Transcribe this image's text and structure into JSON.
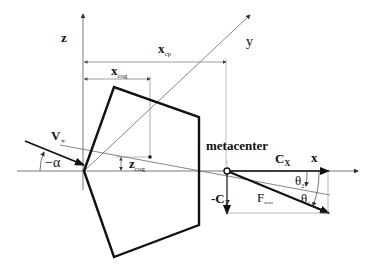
{
  "diagram": {
    "axes": {
      "x_label": "x",
      "y_label": "y",
      "z_label": "z"
    },
    "dimensions": {
      "x_cp": {
        "main": "x",
        "sub": "cp"
      },
      "x_cog": {
        "main": "x",
        "sub": "cog"
      },
      "z_cog": {
        "main": "z",
        "sub": "cog"
      }
    },
    "flow": {
      "velocity": {
        "main": "V",
        "sub": "∞"
      },
      "angle_of_attack": "−α"
    },
    "forces": {
      "metacenter": "metacenter",
      "cx": {
        "main": "C",
        "sub": "X"
      },
      "cz": {
        "main": "-C",
        "sub": "Z"
      },
      "f_aero": {
        "main": "F",
        "sub": "aero"
      },
      "theta1": {
        "main": "θ",
        "sub": "1"
      },
      "theta2": {
        "main": "θ",
        "sub": "2"
      }
    },
    "colors": {
      "stroke": "#111111",
      "thin": "#666666",
      "background": "#ffffff"
    }
  }
}
